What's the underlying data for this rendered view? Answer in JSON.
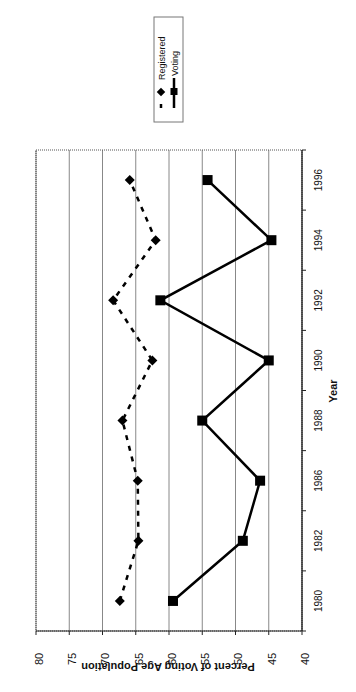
{
  "chart_data": {
    "type": "line",
    "title": "",
    "xlabel": "Year",
    "ylabel": "Percent of Voting Age Population",
    "categories": [
      "1980",
      "1982",
      "1986",
      "1988",
      "1990",
      "1992",
      "1994",
      "1996"
    ],
    "x": [
      1980,
      1982,
      1986,
      1988,
      1990,
      1992,
      1994,
      1996
    ],
    "series": [
      {
        "name": "Registered",
        "style": "dashed",
        "marker": "diamond",
        "values": [
          67.4,
          64.6,
          64.7,
          67.0,
          62.5,
          68.4,
          62.0,
          65.9
        ]
      },
      {
        "name": "Voting",
        "style": "solid",
        "marker": "square",
        "values": [
          59.4,
          48.9,
          46.3,
          55.0,
          45.0,
          61.3,
          44.6,
          54.2
        ]
      }
    ],
    "ylim": [
      40,
      80
    ],
    "yticks": [
      "80",
      "75",
      "70",
      "65",
      "60",
      "55",
      "50",
      "45",
      "40"
    ],
    "grid": true,
    "legend_position": "right",
    "orientation_note": "rotated 90 degrees clockwise on page"
  },
  "legend": {
    "items": [
      {
        "label": "Registered"
      },
      {
        "label": "Voting"
      }
    ]
  },
  "colors": {
    "line": "#000000",
    "grid": "#888888",
    "background": "#ffffff"
  }
}
